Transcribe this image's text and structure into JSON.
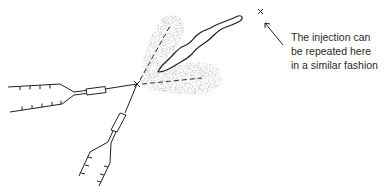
{
  "diagram": {
    "annotation": {
      "lines": [
        "The injection can",
        "be repeated here",
        "in a similar fashion"
      ]
    },
    "markers": {
      "injection_point": "x",
      "repeat_point": "x"
    },
    "colors": {
      "ink": "#333333",
      "stipple": "#9a9a9a",
      "background": "#ffffff"
    }
  }
}
